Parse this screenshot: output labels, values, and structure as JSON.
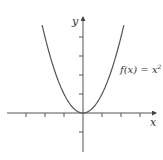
{
  "chart_data": {
    "type": "line",
    "title": "",
    "xlabel": "x",
    "ylabel": "y",
    "function_label": "f(x) = x²",
    "function_label_parts": {
      "lhs": "f(x) = x",
      "exponent": "2"
    },
    "xlim": [
      -4.0,
      3.8
    ],
    "ylim": [
      -2.1,
      4.9
    ],
    "x_ticks": [
      -3,
      -2,
      -1,
      1,
      2,
      3
    ],
    "y_ticks": [
      -1,
      1,
      2,
      3,
      4
    ],
    "grid": false,
    "legend": "none",
    "series": [
      {
        "name": "f(x) = x^2",
        "x": [
          -2.15,
          -2,
          -1.5,
          -1,
          -0.5,
          0,
          0.5,
          1,
          1.5,
          2,
          2.15
        ],
        "y": [
          4.62,
          4,
          2.25,
          1,
          0.25,
          0,
          0.25,
          1,
          2.25,
          4,
          4.62
        ]
      }
    ],
    "colors": {
      "curve": "#555555",
      "axes": "#555555",
      "text": "#333333"
    }
  }
}
